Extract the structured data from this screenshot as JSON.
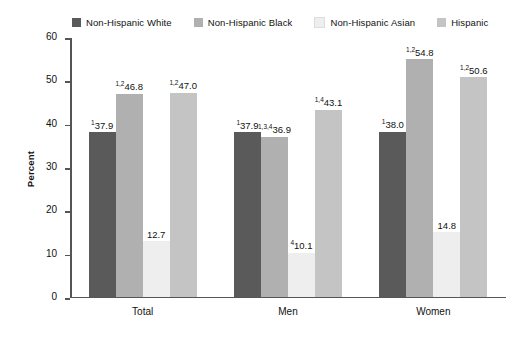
{
  "chart_data": {
    "type": "bar",
    "title": "",
    "xlabel": "",
    "ylabel": "Percent",
    "ylim": [
      0,
      60
    ],
    "yticks": [
      0,
      10,
      20,
      30,
      40,
      50,
      60
    ],
    "grid": false,
    "legend_position": "top",
    "categories": [
      "Total",
      "Men",
      "Women"
    ],
    "series": [
      {
        "name": "Non-Hispanic White",
        "color": "#5a5a5a",
        "values": [
          37.9,
          37.9,
          38.0
        ],
        "labels": [
          "37.9",
          "37.9",
          "38.0"
        ],
        "superscripts": [
          "1",
          "1",
          "1"
        ]
      },
      {
        "name": "Non-Hispanic Black",
        "color": "#b0b0b0",
        "values": [
          46.8,
          36.9,
          54.8
        ],
        "labels": [
          "46.8",
          "36.9",
          "54.8"
        ],
        "superscripts": [
          "1,2",
          "1,3,4",
          "1,2"
        ]
      },
      {
        "name": "Non-Hispanic Asian",
        "color": "#eeeeee",
        "values": [
          12.7,
          10.1,
          14.8
        ],
        "labels": [
          "12.7",
          "10.1",
          "14.8"
        ],
        "superscripts": [
          "",
          "4",
          ""
        ]
      },
      {
        "name": "Hispanic",
        "color": "#c4c4c4",
        "values": [
          47.0,
          43.1,
          50.6
        ],
        "labels": [
          "47.0",
          "43.1",
          "50.6"
        ],
        "superscripts": [
          "1,2",
          "1,4",
          "1,2"
        ]
      }
    ]
  },
  "legend": {
    "items": [
      {
        "label": "Non-Hispanic White",
        "color": "#5a5a5a"
      },
      {
        "label": "Non-Hispanic Black",
        "color": "#b0b0b0"
      },
      {
        "label": "Non-Hispanic Asian",
        "color": "#eeeeee"
      },
      {
        "label": "Hispanic",
        "color": "#c4c4c4"
      }
    ]
  },
  "axis": {
    "y_label": "Percent",
    "y_ticks": [
      "60",
      "50",
      "40",
      "30",
      "20",
      "10",
      "0"
    ]
  },
  "x_labels": [
    "Total",
    "Men",
    "Women"
  ]
}
